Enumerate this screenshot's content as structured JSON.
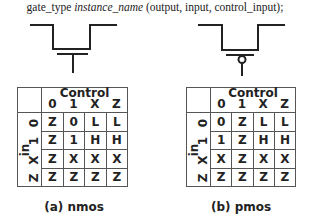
{
  "syntax": {
    "gate_type": "gate_type",
    "instance_name": "instance_name",
    "ports": "(output, input, control_input);"
  },
  "tables": [
    {
      "id": "nmos",
      "caption": "(a) nmos",
      "header_title": "Control",
      "control_values": [
        "0",
        "1",
        "X",
        "Z"
      ],
      "input_label": "in",
      "input_values": [
        "0",
        "1",
        "X",
        "Z"
      ],
      "rows": [
        [
          "Z",
          "0",
          "L",
          "L"
        ],
        [
          "Z",
          "1",
          "H",
          "H"
        ],
        [
          "Z",
          "X",
          "X",
          "X"
        ],
        [
          "Z",
          "Z",
          "Z",
          "Z"
        ]
      ]
    },
    {
      "id": "pmos",
      "caption": "(b) pmos",
      "header_title": "Control",
      "control_values": [
        "0",
        "1",
        "X",
        "Z"
      ],
      "input_label": "in",
      "input_values": [
        "0",
        "1",
        "X",
        "Z"
      ],
      "rows": [
        [
          "0",
          "Z",
          "L",
          "L"
        ],
        [
          "1",
          "Z",
          "H",
          "H"
        ],
        [
          "X",
          "Z",
          "X",
          "X"
        ],
        [
          "Z",
          "Z",
          "Z",
          "Z"
        ]
      ]
    }
  ]
}
